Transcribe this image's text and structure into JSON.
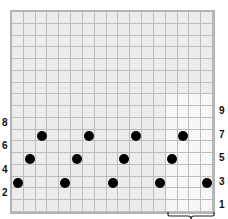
{
  "chart": {
    "cols": 17,
    "rows": 17,
    "repeat": {
      "first_col": 14,
      "last_col": 17,
      "first_row": 1,
      "last_row": 10
    },
    "colors": {
      "grid_bg": "#ececec",
      "repeat_bg": "#f7f7f7",
      "line": "#bdbdbd",
      "dot": "#000000"
    }
  },
  "dots": [
    {
      "row": 3,
      "col": 1
    },
    {
      "row": 3,
      "col": 5
    },
    {
      "row": 3,
      "col": 9
    },
    {
      "row": 3,
      "col": 13
    },
    {
      "row": 3,
      "col": 17
    },
    {
      "row": 5,
      "col": 2
    },
    {
      "row": 5,
      "col": 6
    },
    {
      "row": 5,
      "col": 10
    },
    {
      "row": 5,
      "col": 14
    },
    {
      "row": 7,
      "col": 3
    },
    {
      "row": 7,
      "col": 7
    },
    {
      "row": 7,
      "col": 11
    },
    {
      "row": 7,
      "col": 15
    }
  ],
  "labels": {
    "left": [
      {
        "text": "2",
        "row": 2
      },
      {
        "text": "4",
        "row": 4
      },
      {
        "text": "6",
        "row": 6
      },
      {
        "text": "8",
        "row": 8
      }
    ],
    "right": [
      {
        "text": "1",
        "row": 1
      },
      {
        "text": "3",
        "row": 3
      },
      {
        "text": "5",
        "row": 5
      },
      {
        "text": "7",
        "row": 7
      },
      {
        "text": "9",
        "row": 9
      }
    ]
  },
  "brace": {
    "label": "repeat",
    "icon": "brace-icon"
  }
}
